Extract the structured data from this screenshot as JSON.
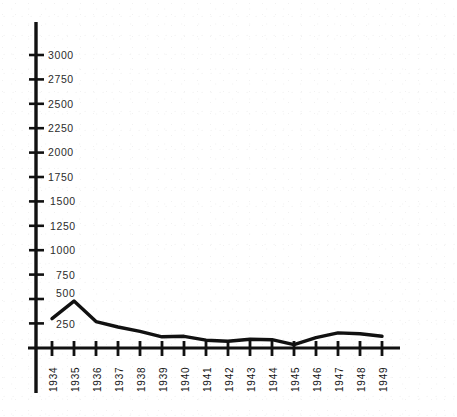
{
  "chart_data": {
    "type": "line",
    "title": "",
    "subtitle": "",
    "xlabel": "",
    "ylabel": "",
    "categories": [
      "1934",
      "1935",
      "1936",
      "1937",
      "1938",
      "1939",
      "1940",
      "1941",
      "1942",
      "1943",
      "1944",
      "1945",
      "1946",
      "1947",
      "1948",
      "1949"
    ],
    "series": [
      {
        "name": "",
        "values": [
          300,
          480,
          270,
          215,
          170,
          115,
          120,
          80,
          70,
          90,
          85,
          35,
          105,
          155,
          145,
          120
        ]
      }
    ],
    "ylim": [
      0,
      3100
    ],
    "xlim_labels": [
      "1934",
      "1949"
    ],
    "y_ticks": [
      250,
      500,
      750,
      1000,
      1250,
      1500,
      1750,
      2000,
      2250,
      2500,
      2750,
      3000
    ],
    "y_tick_labels": [
      "250",
      "500",
      "750",
      "1000",
      "1250",
      "1500",
      "1750",
      "2000",
      "2250",
      "2500",
      "2750",
      "3000"
    ],
    "grid": false,
    "legend": false,
    "legend_position": "none",
    "axis_color": "#111111",
    "line_color": "#111111",
    "background_color": "#ffffff"
  },
  "axes": {
    "y_axis_name": "y-axis",
    "x_axis_name": "x-axis",
    "y_axis_top_value": 3100,
    "y_axis_bottom_value": 0
  }
}
